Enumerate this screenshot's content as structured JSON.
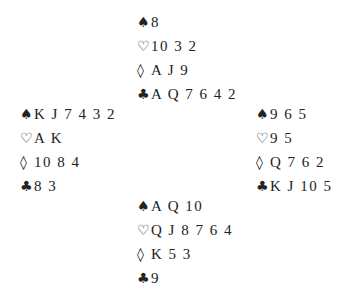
{
  "suits": {
    "spades": "♠",
    "hearts": "♡",
    "diamonds": "◊",
    "clubs": "♣"
  },
  "hands": {
    "north": {
      "spades": "8",
      "hearts": "10 3 2",
      "diamonds": "A J 9",
      "clubs": "A Q 7 6 4 2"
    },
    "west": {
      "spades": "K J 7 4 3 2",
      "hearts": "A K",
      "diamonds": "10 8 4",
      "clubs": "8 3"
    },
    "east": {
      "spades": "9 6 5",
      "hearts": "9 5",
      "diamonds": "Q 7 6 2",
      "clubs": "K J 10 5"
    },
    "south": {
      "spades": "A Q 10",
      "hearts": "Q J 8 7 6 4",
      "diamonds": "K 5 3",
      "clubs": "9"
    }
  }
}
